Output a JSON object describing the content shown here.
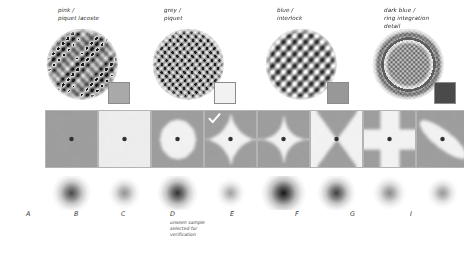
{
  "figure": {
    "background": "#ffffff"
  },
  "samples": [
    {
      "caption": "pink /\npiquet lacoste",
      "swatch_color": "#a9a9a9",
      "texture": "piquet-lacoste",
      "x": 24
    },
    {
      "caption": "grey /\npiquet",
      "swatch_color": "#f2f2f2",
      "texture": "piquet",
      "x": 130
    },
    {
      "caption": "blue /\ninterlock",
      "swatch_color": "#989898",
      "texture": "interlock",
      "x": 243
    },
    {
      "caption": "dark blue /\nring integration\ndetail",
      "swatch_color": "#4a4a4a",
      "texture": "ring-integration",
      "x": 350
    }
  ],
  "tiles": [
    {
      "id": "A",
      "shape": "flat",
      "base": 0.62,
      "inner": 0.62,
      "checked": false,
      "x": 45
    },
    {
      "id": "B",
      "shape": "flat-light",
      "base": 0.93,
      "inner": 0.93,
      "checked": false,
      "x": 98
    },
    {
      "id": "C",
      "shape": "circle",
      "base": 0.62,
      "inner": 0.95,
      "checked": false,
      "x": 151
    },
    {
      "id": "D",
      "shape": "astroid",
      "base": 0.62,
      "inner": 0.95,
      "checked": true,
      "x": 204
    },
    {
      "id": "E",
      "shape": "star4",
      "base": 0.62,
      "inner": 0.95,
      "checked": false,
      "x": 257
    },
    {
      "id": "F",
      "shape": "bowtie-x",
      "base": 0.62,
      "inner": 0.95,
      "checked": false,
      "x": 310
    },
    {
      "id": "G",
      "shape": "cross",
      "base": 0.62,
      "inner": 0.95,
      "checked": false,
      "x": 363
    },
    {
      "id": "I",
      "shape": "ellipse",
      "base": 0.62,
      "inner": 0.95,
      "checked": false,
      "x": 416
    }
  ],
  "spots": [
    {
      "id": "A",
      "intensity": 0.78,
      "radius": 0.58,
      "x": 45
    },
    {
      "id": "B",
      "intensity": 0.46,
      "radius": 0.38,
      "x": 98
    },
    {
      "id": "C",
      "intensity": 0.88,
      "radius": 0.62,
      "x": 151
    },
    {
      "id": "D",
      "intensity": 0.4,
      "radius": 0.3,
      "x": 204
    },
    {
      "id": "E",
      "intensity": 1.0,
      "radius": 0.74,
      "x": 257
    },
    {
      "id": "F",
      "intensity": 0.82,
      "radius": 0.55,
      "x": 310
    },
    {
      "id": "G",
      "intensity": 0.5,
      "radius": 0.42,
      "x": 363
    },
    {
      "id": "I",
      "intensity": 0.44,
      "radius": 0.34,
      "x": 416
    }
  ],
  "labels": [
    {
      "letter": "A",
      "note": "",
      "x": 26
    },
    {
      "letter": "B",
      "note": "",
      "x": 74
    },
    {
      "letter": "C",
      "note": "",
      "x": 121
    },
    {
      "letter": "D",
      "note": "unseen sample\nselected for\nverification",
      "x": 170
    },
    {
      "letter": "E",
      "note": "",
      "x": 230
    },
    {
      "letter": "F",
      "note": "",
      "x": 295
    },
    {
      "letter": "G",
      "note": "",
      "x": 350
    },
    {
      "letter": "I",
      "note": "",
      "x": 410
    }
  ]
}
